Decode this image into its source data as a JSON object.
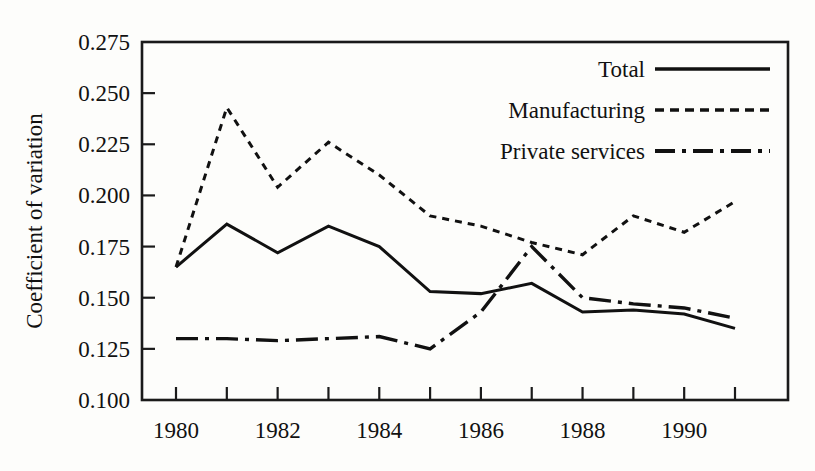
{
  "chart_data": {
    "type": "line",
    "title": "",
    "xlabel": "",
    "ylabel": "Coefficient of variation",
    "xlim": [
      1980,
      1991
    ],
    "ylim": [
      0.1,
      0.275
    ],
    "ytick_step": 0.025,
    "grid": false,
    "legend_position": "top-right",
    "x": [
      1980,
      1981,
      1982,
      1983,
      1984,
      1985,
      1986,
      1987,
      1988,
      1989,
      1990,
      1991
    ],
    "xticks": [
      1980,
      1981,
      1982,
      1983,
      1984,
      1985,
      1986,
      1987,
      1988,
      1989,
      1990,
      1991
    ],
    "xtick_labels": [
      "1980",
      "",
      "1982",
      "",
      "1984",
      "",
      "1986",
      "",
      "1988",
      "",
      "1990",
      ""
    ],
    "ytick_labels": [
      "0.100",
      "0.125",
      "0.150",
      "0.175",
      "0.200",
      "0.225",
      "0.250",
      "0.275"
    ],
    "ytick_values": [
      0.1,
      0.125,
      0.15,
      0.175,
      0.2,
      0.225,
      0.25,
      0.275
    ],
    "series": [
      {
        "name": "Total",
        "style": "solid",
        "values": [
          0.165,
          0.186,
          0.172,
          0.185,
          0.175,
          0.153,
          0.152,
          0.157,
          0.143,
          0.144,
          0.142,
          0.135
        ]
      },
      {
        "name": "Manufacturing",
        "style": "dotted",
        "values": [
          0.165,
          0.243,
          0.204,
          0.226,
          0.21,
          0.19,
          0.185,
          0.177,
          0.171,
          0.19,
          0.182,
          0.197
        ]
      },
      {
        "name": "Private services",
        "style": "dashdot",
        "values": [
          0.13,
          0.13,
          0.129,
          0.13,
          0.131,
          0.125,
          0.143,
          0.175,
          0.15,
          0.147,
          0.145,
          0.14
        ]
      }
    ]
  },
  "legend": {
    "entries": [
      {
        "label": "Total",
        "style": "solid"
      },
      {
        "label": "Manufacturing",
        "style": "dotted"
      },
      {
        "label": "Private services",
        "style": "dashdot"
      }
    ]
  },
  "colors": {
    "ink": "#111111",
    "background": "#fdfdfb"
  }
}
